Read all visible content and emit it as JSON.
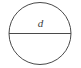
{
  "figure": {
    "kind": "geometry-diagram",
    "background_color": "#ffffff",
    "stroke_color": "#4a4a4a",
    "label_color": "#3c3c3c",
    "circle": {
      "center_x": 40,
      "center_y": 33.5,
      "radius": 31,
      "stroke_width": 1
    },
    "diameter_line": {
      "x1": 9,
      "y1": 33.5,
      "x2": 71,
      "y2": 33.5,
      "stroke_width": 1
    },
    "labels": {
      "diameter": "d"
    }
  }
}
